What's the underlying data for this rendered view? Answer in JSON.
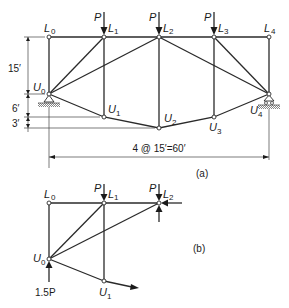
{
  "figure": {
    "part_a": {
      "caption": "(a)",
      "span_dimension": "4 @ 15′=60′",
      "vertical_dims": [
        "15′",
        "6′",
        "3′"
      ],
      "load_label": "P",
      "top_joints": [
        {
          "name": "L",
          "sub": "0"
        },
        {
          "name": "L",
          "sub": "1"
        },
        {
          "name": "L",
          "sub": "2"
        },
        {
          "name": "L",
          "sub": "3"
        },
        {
          "name": "L",
          "sub": "4"
        }
      ],
      "bottom_joints": [
        {
          "name": "U",
          "sub": "0"
        },
        {
          "name": "U",
          "sub": "1"
        },
        {
          "name": "U",
          "sub": "2"
        },
        {
          "name": "U",
          "sub": "3"
        },
        {
          "name": "U",
          "sub": "4"
        }
      ]
    },
    "part_b": {
      "caption": "(b)",
      "load_label": "P",
      "reaction_label": "1.5P",
      "top_joints": [
        {
          "name": "L",
          "sub": "0"
        },
        {
          "name": "L",
          "sub": "1"
        },
        {
          "name": "L",
          "sub": "2"
        }
      ],
      "bottom_joints": [
        {
          "name": "U",
          "sub": "0"
        },
        {
          "name": "U",
          "sub": "1"
        }
      ]
    }
  }
}
